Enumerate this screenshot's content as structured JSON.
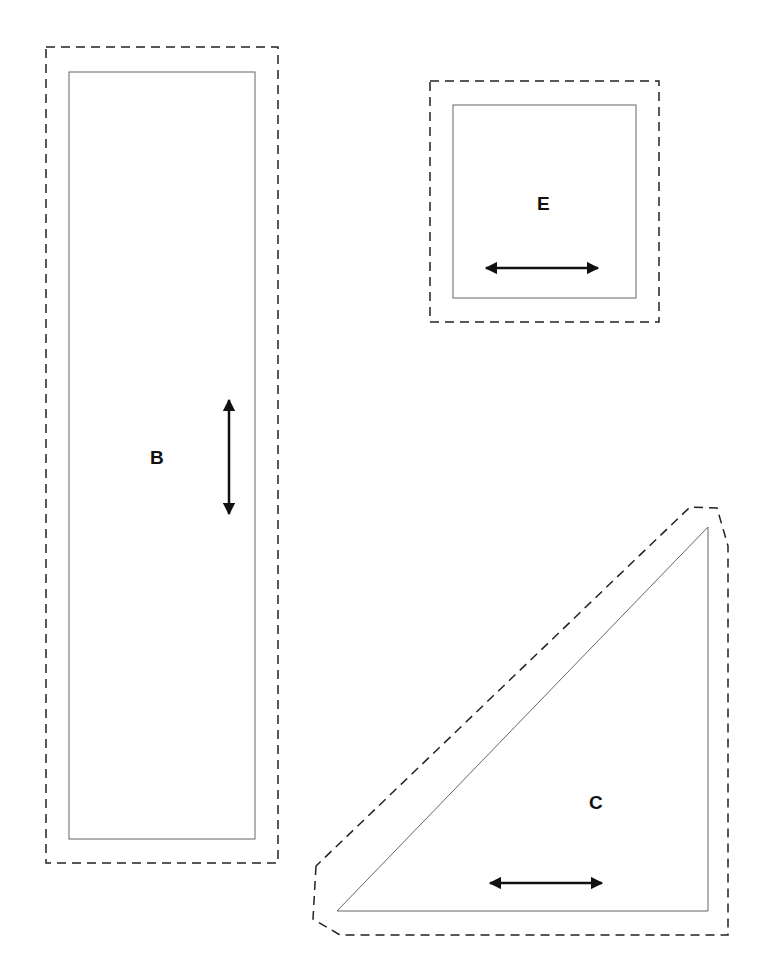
{
  "diagram": {
    "type": "sewing-pattern-pieces",
    "colors": {
      "background": "#ffffff",
      "cut_line": "#222222",
      "seam_line": "#666666",
      "text": "#111111"
    },
    "pieces": [
      {
        "label": "B",
        "shape": "rectangle",
        "grainline": "vertical"
      },
      {
        "label": "E",
        "shape": "square",
        "grainline": "horizontal"
      },
      {
        "label": "C",
        "shape": "right-triangle",
        "grainline": "horizontal"
      }
    ],
    "legend": {
      "dashed": "cutting line",
      "solid": "seam line",
      "arrow": "grainline"
    }
  }
}
